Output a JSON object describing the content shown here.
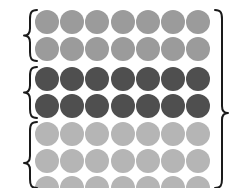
{
  "figure": {
    "name": "grouped-dot-matrix",
    "background_color": "#ffffff",
    "width": 240,
    "height": 188,
    "columns": 7,
    "column_start_x": 47,
    "column_spacing": 25.2,
    "dot_radius": 12,
    "dot_border_color": "#ffffff"
  },
  "groups": [
    {
      "id": "group-1",
      "label": "",
      "shade_name": "medium-gray",
      "color": "#9b9b9b",
      "rows": [
        {
          "y": 22,
          "dots": 7
        },
        {
          "y": 49,
          "dots": 7
        }
      ],
      "brace": {
        "name": "left-brace-group-1",
        "side": "left",
        "x": 30,
        "top": 10,
        "bottom": 61,
        "tip_y": 35.5
      }
    },
    {
      "id": "group-2",
      "label": "",
      "shade_name": "dark-gray",
      "color": "#4f4f4f",
      "rows": [
        {
          "y": 79,
          "dots": 7
        },
        {
          "y": 106,
          "dots": 7
        }
      ],
      "brace": {
        "name": "left-brace-group-2",
        "side": "left",
        "x": 30,
        "top": 67,
        "bottom": 118,
        "tip_y": 92.5
      }
    },
    {
      "id": "group-3",
      "label": "",
      "shade_name": "light-gray",
      "color": "#b5b5b5",
      "rows": [
        {
          "y": 134,
          "dots": 7
        },
        {
          "y": 161,
          "dots": 7
        },
        {
          "y": 188,
          "dots": 7
        }
      ],
      "brace": {
        "name": "left-brace-group-3",
        "side": "left",
        "x": 30,
        "top": 122,
        "bottom": 188,
        "tip_y": 163
      }
    }
  ],
  "outer_brace": {
    "name": "right-outer-brace",
    "side": "right",
    "x": 222,
    "top": 10,
    "bottom": 188,
    "tip_y": 113
  },
  "colors": {
    "stroke": "#1a1a1a",
    "medium_gray": "#9b9b9b",
    "dark_gray": "#4f4f4f",
    "light_gray": "#b5b5b5"
  }
}
